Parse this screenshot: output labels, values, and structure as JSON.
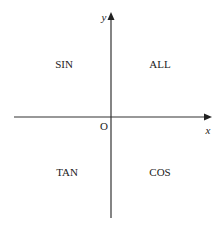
{
  "diagram": {
    "type": "cartesian-axes-quadrant-rule",
    "axes": {
      "x_label": "x",
      "y_label": "y",
      "origin_label": "O",
      "color": "#333333"
    },
    "quadrants": [
      {
        "position": "top-left",
        "label": "SIN"
      },
      {
        "position": "top-right",
        "label": "ALL"
      },
      {
        "position": "bottom-left",
        "label": "TAN"
      },
      {
        "position": "bottom-right",
        "label": "COS"
      }
    ]
  }
}
